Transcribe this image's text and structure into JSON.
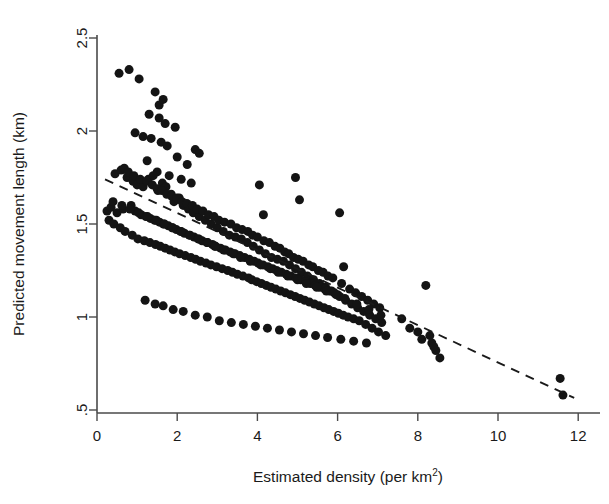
{
  "chart_data": {
    "type": "scatter",
    "title": "",
    "xlabel": "Estimated density (per km2)",
    "xlabel_base": "Estimated density (per km",
    "xlabel_sup": "2",
    "xlabel_close": ")",
    "ylabel": "Predicted movement length (km)",
    "xlim": [
      -0.15,
      12.4
    ],
    "ylim": [
      0.44,
      2.58
    ],
    "xticks": [
      0,
      2,
      4,
      6,
      8,
      10,
      12
    ],
    "xtick_labels": [
      "0",
      "2",
      "4",
      "6",
      "8",
      "10",
      "12"
    ],
    "yticks": [
      0.5,
      1,
      1.5,
      2,
      2.5
    ],
    "ytick_labels": [
      ".5",
      "1",
      "1.5",
      "2",
      "2.5"
    ],
    "grid": false,
    "legend": "none",
    "marker": "filled-circle",
    "marker_color": "#141414",
    "marker_size_px": 9,
    "trendline": {
      "style": "dashed",
      "color": "#1a1a1a",
      "x_start": 0.2,
      "y_start": 1.74,
      "x_end": 11.9,
      "y_end": 0.565,
      "description": "dashed fitted decline from about 1.74 km at 0.2 per km2 down to about 0.57 km at 11.9 per km2"
    },
    "x": [
      0.55,
      0.8,
      1.05,
      1.45,
      1.3,
      1.55,
      1.7,
      1.95,
      1.35,
      1.6,
      1.75,
      2.0,
      2.25,
      1.25,
      1.5,
      1.8,
      2.1,
      2.35,
      0.45,
      0.6,
      0.75,
      0.9,
      1.0,
      1.15,
      1.28,
      1.4,
      1.52,
      1.63,
      1.72,
      1.85,
      1.92,
      2.05,
      2.15,
      2.28,
      2.4,
      2.55,
      2.7,
      2.85,
      3.0,
      3.15,
      3.3,
      3.45,
      3.6,
      3.75,
      3.9,
      4.05,
      4.2,
      4.35,
      4.5,
      4.65,
      4.8,
      4.95,
      5.1,
      5.25,
      5.4,
      5.55,
      5.7,
      5.85,
      6.0,
      0.25,
      0.35,
      0.5,
      0.65,
      0.85,
      0.95,
      1.1,
      1.22,
      1.33,
      1.44,
      1.56,
      1.66,
      1.78,
      1.88,
      1.98,
      2.08,
      2.18,
      2.3,
      2.42,
      2.52,
      2.62,
      2.74,
      2.88,
      2.96,
      3.08,
      3.2,
      3.32,
      3.44,
      3.56,
      3.68,
      3.8,
      3.92,
      4.02,
      4.14,
      4.26,
      4.38,
      4.48,
      4.6,
      4.72,
      4.84,
      4.96,
      5.08,
      5.2,
      5.32,
      5.44,
      5.56,
      5.68,
      5.8,
      5.92,
      6.05,
      6.2,
      6.35,
      6.5,
      6.65,
      6.8,
      6.95,
      7.1,
      0.3,
      0.42,
      0.58,
      0.7,
      0.88,
      1.02,
      1.18,
      1.32,
      1.46,
      1.58,
      1.7,
      1.82,
      1.94,
      2.06,
      2.2,
      2.34,
      2.46,
      2.58,
      2.72,
      2.84,
      2.98,
      3.12,
      3.26,
      3.38,
      3.5,
      3.64,
      3.78,
      3.86,
      3.98,
      4.1,
      4.22,
      4.34,
      4.46,
      4.58,
      4.7,
      4.82,
      4.94,
      5.06,
      5.18,
      5.3,
      5.42,
      5.54,
      5.66,
      5.78,
      5.9,
      6.02,
      6.14,
      6.26,
      6.4,
      6.54,
      6.7,
      6.86,
      7.02,
      7.2,
      7.6,
      7.8,
      8.0,
      8.2,
      8.35,
      8.45,
      8.55,
      11.55,
      11.62,
      0.68,
      0.78,
      0.92,
      1.08,
      1.24,
      1.38,
      1.5,
      1.62,
      1.74,
      1.86,
      1.99,
      2.12,
      2.24,
      2.38,
      2.5,
      2.64,
      2.78,
      2.92,
      3.04,
      3.18,
      3.34,
      3.48,
      3.62,
      3.76,
      3.88,
      4.0,
      4.16,
      4.3,
      4.44,
      4.56,
      4.68,
      4.78,
      4.9,
      5.02,
      5.14,
      5.28,
      5.38,
      5.52,
      5.64,
      5.76,
      5.88,
      6.1,
      6.3,
      6.45,
      6.6,
      6.75,
      6.9,
      7.05,
      1.2,
      1.45,
      1.65,
      1.9,
      2.15,
      2.45,
      2.75,
      3.05,
      3.35,
      3.65,
      3.95,
      4.25,
      4.55,
      4.85,
      5.15,
      5.45,
      5.75,
      6.08,
      6.4,
      6.72,
      0.4,
      0.62,
      0.82,
      1.04,
      1.26,
      1.48,
      1.68,
      1.88,
      2.1,
      2.32,
      2.54,
      2.76,
      2.94,
      3.16,
      3.4,
      3.58,
      3.82,
      4.08,
      4.32,
      4.52,
      4.76,
      5.0,
      5.22,
      5.48,
      5.72,
      5.96,
      6.18,
      6.48,
      6.78,
      7.08,
      8.1,
      8.3,
      8.4,
      4.05,
      4.15,
      4.95,
      5.05,
      6.05,
      6.15,
      2.45,
      2.55,
      1.55,
      1.65,
      0.95,
      1.15
    ],
    "y": [
      2.31,
      2.33,
      2.28,
      2.21,
      2.09,
      2.07,
      2.04,
      2.02,
      1.96,
      1.94,
      1.92,
      1.86,
      1.82,
      1.84,
      1.78,
      1.76,
      1.74,
      1.72,
      1.77,
      1.79,
      1.75,
      1.73,
      1.71,
      1.7,
      1.74,
      1.76,
      1.68,
      1.72,
      1.7,
      1.66,
      1.62,
      1.64,
      1.6,
      1.58,
      1.56,
      1.54,
      1.52,
      1.5,
      1.48,
      1.46,
      1.44,
      1.43,
      1.42,
      1.4,
      1.38,
      1.36,
      1.34,
      1.32,
      1.31,
      1.3,
      1.28,
      1.26,
      1.24,
      1.22,
      1.2,
      1.18,
      1.16,
      1.14,
      1.12,
      1.57,
      1.59,
      1.56,
      1.58,
      1.6,
      1.57,
      1.55,
      1.54,
      1.53,
      1.52,
      1.51,
      1.5,
      1.49,
      1.48,
      1.47,
      1.46,
      1.45,
      1.44,
      1.43,
      1.42,
      1.41,
      1.4,
      1.39,
      1.38,
      1.37,
      1.36,
      1.35,
      1.34,
      1.33,
      1.32,
      1.31,
      1.3,
      1.29,
      1.28,
      1.27,
      1.26,
      1.25,
      1.24,
      1.23,
      1.22,
      1.21,
      1.2,
      1.19,
      1.18,
      1.17,
      1.16,
      1.15,
      1.14,
      1.13,
      1.11,
      1.09,
      1.07,
      1.05,
      1.03,
      1.01,
      0.99,
      0.97,
      1.52,
      1.5,
      1.48,
      1.46,
      1.44,
      1.42,
      1.41,
      1.4,
      1.39,
      1.38,
      1.37,
      1.36,
      1.35,
      1.34,
      1.33,
      1.32,
      1.31,
      1.3,
      1.29,
      1.28,
      1.27,
      1.26,
      1.25,
      1.24,
      1.23,
      1.22,
      1.21,
      1.2,
      1.19,
      1.18,
      1.17,
      1.16,
      1.15,
      1.14,
      1.13,
      1.12,
      1.11,
      1.1,
      1.09,
      1.08,
      1.07,
      1.06,
      1.05,
      1.04,
      1.03,
      1.02,
      1.01,
      1.0,
      0.99,
      0.98,
      0.96,
      0.94,
      0.92,
      0.9,
      0.99,
      0.94,
      0.92,
      1.17,
      0.86,
      0.82,
      0.78,
      0.67,
      0.58,
      1.8,
      1.78,
      1.76,
      1.74,
      1.73,
      1.71,
      1.69,
      1.68,
      1.66,
      1.65,
      1.64,
      1.62,
      1.61,
      1.6,
      1.58,
      1.57,
      1.55,
      1.54,
      1.52,
      1.51,
      1.5,
      1.48,
      1.47,
      1.46,
      1.44,
      1.43,
      1.41,
      1.4,
      1.38,
      1.37,
      1.35,
      1.34,
      1.32,
      1.31,
      1.3,
      1.28,
      1.27,
      1.25,
      1.24,
      1.22,
      1.21,
      1.18,
      1.15,
      1.13,
      1.11,
      1.09,
      1.07,
      1.05,
      1.09,
      1.07,
      1.06,
      1.04,
      1.03,
      1.01,
      1.0,
      0.98,
      0.97,
      0.96,
      0.95,
      0.94,
      0.93,
      0.92,
      0.91,
      0.9,
      0.89,
      0.88,
      0.87,
      0.86,
      1.62,
      1.6,
      1.58,
      1.56,
      1.54,
      1.52,
      1.5,
      1.48,
      1.46,
      1.44,
      1.42,
      1.4,
      1.38,
      1.36,
      1.34,
      1.32,
      1.3,
      1.28,
      1.26,
      1.24,
      1.22,
      1.2,
      1.18,
      1.16,
      1.14,
      1.12,
      1.1,
      1.07,
      1.04,
      1.01,
      0.88,
      0.9,
      0.84,
      1.71,
      1.55,
      1.75,
      1.63,
      1.56,
      1.27,
      1.9,
      1.88,
      2.14,
      2.17,
      1.99,
      1.97
    ]
  }
}
